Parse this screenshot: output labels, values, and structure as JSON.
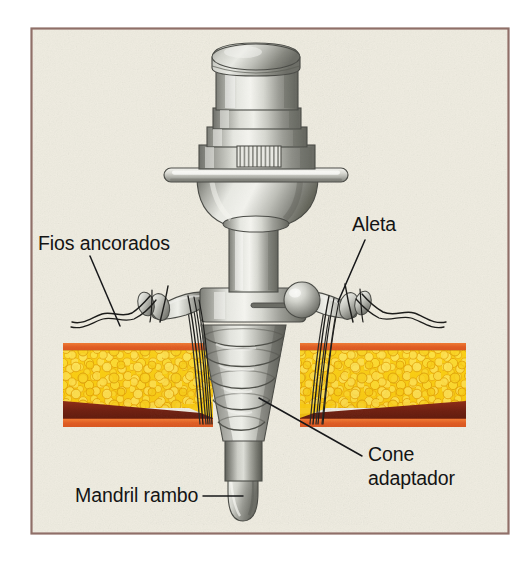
{
  "figure": {
    "frame": {
      "border_color": "#8f6f68",
      "background_color": "#efece0"
    },
    "page_background": "#ffffff"
  },
  "labels": [
    {
      "id": "fios-ancorados",
      "text": "Fios ancorados",
      "lines": [
        "Fios ancorados"
      ],
      "x": 38,
      "y": 250,
      "anchor": "start"
    },
    {
      "id": "aleta",
      "text": "Aleta",
      "lines": [
        "Aleta"
      ],
      "x": 352,
      "y": 231,
      "anchor": "start"
    },
    {
      "id": "cone-adaptador",
      "text": "Cone adaptador",
      "lines": [
        "Cone",
        "adaptador"
      ],
      "x": 368,
      "y": 461,
      "anchor": "start"
    },
    {
      "id": "mandril-rambo",
      "text": "Mandril rambo",
      "lines": [
        "Mandril rambo"
      ],
      "x": 75,
      "y": 502,
      "anchor": "start"
    }
  ],
  "leader_lines": [
    {
      "id": "leader-fios-ancorados",
      "from": [
        90,
        256
      ],
      "to": [
        120,
        326
      ],
      "style": "straight"
    },
    {
      "id": "leader-aleta",
      "from": [
        365,
        240
      ],
      "to": [
        338,
        302
      ],
      "style": "straight"
    },
    {
      "id": "leader-cone-adaptador",
      "from": [
        362,
        456
      ],
      "to": [
        259,
        398
      ],
      "style": "straight"
    },
    {
      "id": "leader-mandril-rambo",
      "from": [
        203,
        496
      ],
      "to": [
        243,
        496
      ],
      "style": "straight"
    }
  ],
  "anatomy": {
    "layers": [
      {
        "name": "epidermis-line-top",
        "color": "#e2622a",
        "y": 344,
        "height": 7
      },
      {
        "name": "fat-tissue",
        "color": "#f7c917",
        "highlight": "#fde96a",
        "shadow": "#e09a0c",
        "y": 351,
        "height": 56
      },
      {
        "name": "muscle-fascia",
        "color": "#7a2414",
        "y": 400,
        "height": 22
      },
      {
        "name": "epidermis-line-bottom",
        "color": "#e2622a",
        "y": 418,
        "height": 8
      }
    ]
  },
  "device": {
    "material_colors": {
      "light": "#f2f2ee",
      "mid": "#b8b9b2",
      "dark": "#74756e",
      "outline": "#4a4b46"
    },
    "parts": [
      {
        "name": "cap-dome",
        "label": "Top cap dome"
      },
      {
        "name": "stepped-body",
        "label": "Stepped cylindrical body"
      },
      {
        "name": "ribbed-detail",
        "label": "Ribbed / knurled panel"
      },
      {
        "name": "flange-disc",
        "label": "Horizontal flange disc"
      },
      {
        "name": "conical-skirt",
        "label": "Conical skirt"
      },
      {
        "name": "shaft",
        "label": "Cylindrical shaft"
      },
      {
        "name": "wing-left",
        "label": "Left wing (aleta)"
      },
      {
        "name": "wing-right",
        "label": "Right wing (aleta)"
      },
      {
        "name": "knob-left",
        "label": "Left wing knob"
      },
      {
        "name": "knob-right",
        "label": "Right wing knob"
      },
      {
        "name": "hub-collar",
        "label": "Hub collar with slot"
      },
      {
        "name": "threaded-cone",
        "label": "Threaded adapter cone"
      },
      {
        "name": "mandrel-shaft",
        "label": "Mandrel shaft"
      },
      {
        "name": "mandrel-tip",
        "label": "Rounded mandrel tip"
      }
    ]
  },
  "sutures": {
    "color": "#1c1c1c",
    "description": "Anchored wires / sutures passing through the wings and down into the tissue"
  }
}
